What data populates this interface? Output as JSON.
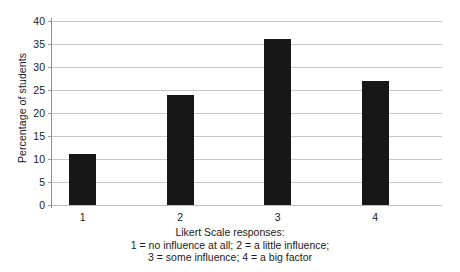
{
  "chart_data": {
    "type": "bar",
    "title": "",
    "categories": [
      "1",
      "2",
      "3",
      "4"
    ],
    "values": [
      11,
      24,
      36,
      27
    ],
    "series": [
      {
        "name": "Percentage of students",
        "values": [
          11,
          24,
          36,
          27
        ]
      }
    ],
    "xlabel": "Likert Scale responses:",
    "ylabel": "Percentage of students",
    "ylim": [
      0,
      40
    ],
    "ytick_step": 5,
    "yticks": [
      0,
      5,
      10,
      15,
      20,
      25,
      30,
      35,
      40
    ],
    "ytick_labels": [
      "0",
      "5",
      "10",
      "15",
      "20",
      "25",
      "30",
      "35",
      "40"
    ],
    "grid": true,
    "legend": "none",
    "bar_color": "#171717",
    "grid_color": "#c9c9c9",
    "caption_lines": [
      "Likert Scale responses:",
      "1 = no influence at all; 2 = a little influence;",
      "3 = some influence; 4 = a big factor"
    ]
  }
}
